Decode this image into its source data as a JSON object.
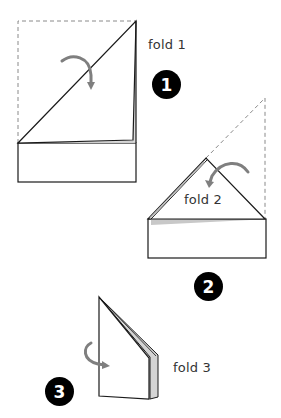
{
  "diagram": {
    "type": "origami-folding-instructions",
    "steps": [
      {
        "number": "1",
        "label": "fold 1"
      },
      {
        "number": "2",
        "label": "fold 2"
      },
      {
        "number": "3",
        "label": "fold 3"
      }
    ],
    "colors": {
      "line": "#1a1a1a",
      "dashed": "#8a8a8a",
      "arrow": "#7f7f7f",
      "shadow": "#c8c8c8",
      "badge": "#000000"
    }
  }
}
